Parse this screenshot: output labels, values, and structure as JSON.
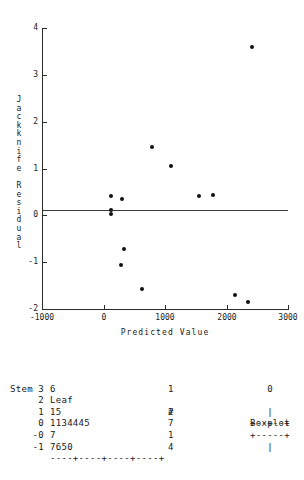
{
  "chart_data": {
    "type": "scatter",
    "title": "",
    "xlabel": "Predicted Value",
    "ylabel": "Jackknife Residual",
    "xlim": [
      -1000,
      3000
    ],
    "ylim": [
      -2,
      4
    ],
    "xticks": [
      -1000,
      0,
      1000,
      2000,
      3000
    ],
    "yticks": [
      -2,
      -1,
      0,
      1,
      2,
      3,
      4
    ],
    "grid": false,
    "legend": null,
    "reference_lines": [
      {
        "axis": "y",
        "value": 0
      }
    ],
    "points": [
      {
        "x": 2420,
        "y": 3.6
      },
      {
        "x": 790,
        "y": 1.45
      },
      {
        "x": 1090,
        "y": 1.05
      },
      {
        "x": 1780,
        "y": 0.44
      },
      {
        "x": 1560,
        "y": 0.42
      },
      {
        "x": 300,
        "y": 0.35
      },
      {
        "x": 120,
        "y": 0.41
      },
      {
        "x": 120,
        "y": 0.11
      },
      {
        "x": 120,
        "y": 0.04
      },
      {
        "x": 330,
        "y": -0.72
      },
      {
        "x": 280,
        "y": -1.05
      },
      {
        "x": 620,
        "y": -1.58
      },
      {
        "x": 2140,
        "y": -1.69
      },
      {
        "x": 2350,
        "y": -1.86
      }
    ]
  },
  "scatter": {
    "y_tick_labels": [
      "4",
      "3",
      "2",
      "1",
      "0",
      "-1",
      "-2"
    ],
    "x_tick_labels": [
      "-1000",
      "0",
      "1000",
      "2000",
      "3000"
    ],
    "x_axis_title": "Predicted Value",
    "y_axis_title_chars": [
      "J",
      "a",
      "c",
      "k",
      "k",
      "n",
      "i",
      "f",
      "e",
      "",
      "R",
      "e",
      "s",
      "i",
      "d",
      "u",
      "a",
      "l"
    ]
  },
  "stemleaf": {
    "headers": {
      "stem": "Stem",
      "leaf": "Leaf",
      "count": "#",
      "boxplot": "Boxplot"
    },
    "rows": [
      {
        "stem": "3",
        "leaf": "6",
        "count": "1",
        "boxplot": "0"
      },
      {
        "stem": "2",
        "leaf": "",
        "count": "",
        "boxplot": ""
      },
      {
        "stem": "1",
        "leaf": "15",
        "count": "2",
        "boxplot": "|"
      },
      {
        "stem": "0",
        "leaf": "1134445",
        "count": "7",
        "boxplot": "+--+--+"
      },
      {
        "stem": "-0",
        "leaf": "7",
        "count": "1",
        "boxplot": "+-----+"
      },
      {
        "stem": "-1",
        "leaf": "7650",
        "count": "4",
        "boxplot": "|"
      }
    ],
    "axis": "----+----+----+----+"
  }
}
